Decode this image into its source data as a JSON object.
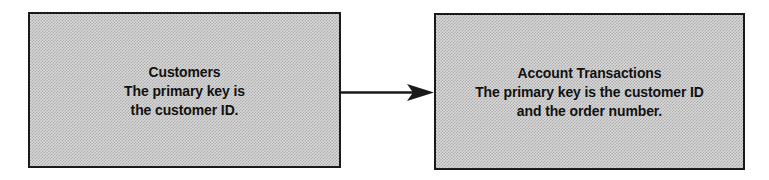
{
  "diagram": {
    "type": "entity-relationship",
    "background_color": "#ffffff",
    "box_fill_color": "#d9d9d9",
    "box_border_color": "#1a1a1a",
    "text_color": "#111111",
    "arrow_color": "#1a1a1a",
    "entities": [
      {
        "id": "customers",
        "title": "Customers",
        "description_lines": [
          "The primary key is",
          "the customer ID."
        ]
      },
      {
        "id": "account-transactions",
        "title": "Account Transactions",
        "description_lines": [
          "The primary key is the customer ID",
          "and the order number."
        ]
      }
    ],
    "relationship": {
      "from": "customers",
      "to": "account-transactions",
      "style": "solid-line-with-filled-arrowhead",
      "direction": "right",
      "label": ""
    }
  }
}
